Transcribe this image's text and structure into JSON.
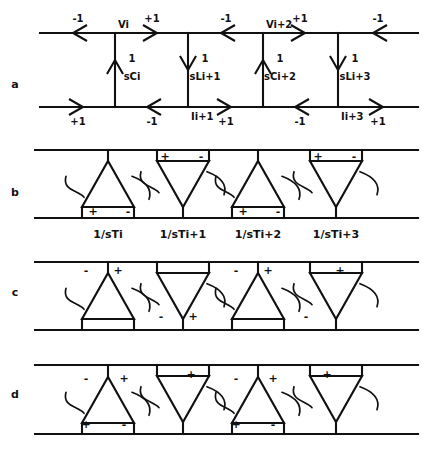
{
  "figure": {
    "type": "circuit-signal-flow-diagram",
    "width": 428,
    "height": 458,
    "ink_color": "#111111",
    "background": "#ffffff"
  },
  "panels": [
    {
      "id": "a",
      "label": "a",
      "label_x": 15,
      "label_y": 88,
      "kind": "lc-ladder",
      "top_rail_y": 33,
      "bottom_rail_y": 107,
      "rail_x0": 40,
      "rail_x1": 418,
      "branches": [
        {
          "x": 115,
          "direction": "up",
          "numerator": "1",
          "denominator": "sCi",
          "num_x": 132,
          "num_y": 62,
          "den_x": 132,
          "den_y": 80
        },
        {
          "x": 188,
          "direction": "down",
          "numerator": "1",
          "denominator": "sLi+1",
          "num_x": 205,
          "num_y": 62,
          "den_x": 205,
          "den_y": 80
        },
        {
          "x": 263,
          "direction": "up",
          "numerator": "1",
          "denominator": "sCi+2",
          "num_x": 280,
          "num_y": 62,
          "den_x": 280,
          "den_y": 80
        },
        {
          "x": 338,
          "direction": "down",
          "numerator": "1",
          "denominator": "sLi+3",
          "num_x": 355,
          "num_y": 62,
          "den_x": 355,
          "den_y": 80
        }
      ],
      "top_arrows": [
        {
          "x": 78,
          "direction": "left",
          "gain": "-1",
          "gain_x": 78,
          "gain_y": 22
        },
        {
          "x": 152,
          "direction": "right",
          "gain": "+1",
          "gain_x": 152,
          "gain_y": 22
        },
        {
          "x": 226,
          "direction": "left",
          "gain": "-1",
          "gain_x": 226,
          "gain_y": 22
        },
        {
          "x": 300,
          "direction": "right",
          "gain": "+1",
          "gain_x": 300,
          "gain_y": 22
        },
        {
          "x": 378,
          "direction": "left",
          "gain": "-1",
          "gain_x": 378,
          "gain_y": 22
        }
      ],
      "bottom_arrows": [
        {
          "x": 78,
          "direction": "right",
          "gain": "+1",
          "gain_x": 78,
          "gain_y": 125
        },
        {
          "x": 152,
          "direction": "left",
          "gain": "-1",
          "gain_x": 152,
          "gain_y": 125
        },
        {
          "x": 226,
          "direction": "right",
          "gain": "+1",
          "gain_x": 226,
          "gain_y": 125
        },
        {
          "x": 300,
          "direction": "left",
          "gain": "-1",
          "gain_x": 300,
          "gain_y": 125
        },
        {
          "x": 378,
          "direction": "right",
          "gain": "+1",
          "gain_x": 378,
          "gain_y": 125
        }
      ],
      "node_labels": [
        {
          "text": "Vi",
          "x": 118,
          "y": 28,
          "anchor": "start"
        },
        {
          "text": "Vi+2",
          "x": 266,
          "y": 28,
          "anchor": "start"
        },
        {
          "text": "Ii+1",
          "x": 191,
          "y": 120,
          "anchor": "start"
        },
        {
          "text": "Ii+3",
          "x": 341,
          "y": 120,
          "anchor": "start"
        }
      ]
    },
    {
      "id": "b",
      "label": "b",
      "label_x": 15,
      "label_y": 196,
      "kind": "amplifier-row",
      "top_rail_y": 150,
      "bottom_rail_y": 218,
      "rail_x0": 35,
      "rail_x1": 418,
      "caption_y": 238,
      "elements": [
        {
          "x": 108,
          "orientation": "up",
          "caption": "1/sTi",
          "caption_x": 108,
          "signs": [
            {
              "t": "+",
              "x": 93,
              "y": 215
            },
            {
              "t": "-",
              "x": 128,
              "y": 215
            }
          ]
        },
        {
          "x": 183,
          "orientation": "down",
          "caption": "1/sTi+1",
          "caption_x": 183,
          "signs": [
            {
              "t": "+",
              "x": 165,
              "y": 160
            },
            {
              "t": "-",
              "x": 201,
              "y": 160
            }
          ]
        },
        {
          "x": 258,
          "orientation": "up",
          "caption": "1/sTi+2",
          "caption_x": 258,
          "signs": [
            {
              "t": "+",
              "x": 243,
              "y": 215
            },
            {
              "t": "-",
              "x": 278,
              "y": 215
            }
          ]
        },
        {
          "x": 336,
          "orientation": "down",
          "caption": "1/sTi+3",
          "caption_x": 336,
          "signs": [
            {
              "t": "+",
              "x": 318,
              "y": 160
            },
            {
              "t": "-",
              "x": 354,
              "y": 160
            }
          ]
        }
      ]
    },
    {
      "id": "c",
      "label": "c",
      "label_x": 15,
      "label_y": 296,
      "kind": "amplifier-row",
      "top_rail_y": 262,
      "bottom_rail_y": 330,
      "rail_x0": 35,
      "rail_x1": 418,
      "elements": [
        {
          "x": 108,
          "orientation": "up",
          "signs": [
            {
              "t": "-",
              "x": 86,
              "y": 274
            },
            {
              "t": "+",
              "x": 118,
              "y": 274
            }
          ]
        },
        {
          "x": 183,
          "orientation": "down",
          "signs": [
            {
              "t": "-",
              "x": 161,
              "y": 320
            },
            {
              "t": "+",
              "x": 193,
              "y": 320
            }
          ]
        },
        {
          "x": 258,
          "orientation": "up",
          "signs": [
            {
              "t": "-",
              "x": 236,
              "y": 274
            },
            {
              "t": "+",
              "x": 268,
              "y": 274
            }
          ]
        },
        {
          "x": 336,
          "orientation": "down",
          "signs": [
            {
              "t": "-",
              "x": 306,
              "y": 320
            },
            {
              "t": "+",
              "x": 340,
              "y": 274
            }
          ]
        }
      ]
    },
    {
      "id": "d",
      "label": "d",
      "label_x": 15,
      "label_y": 398,
      "kind": "amplifier-row",
      "top_rail_y": 365,
      "bottom_rail_y": 434,
      "rail_x0": 35,
      "rail_x1": 418,
      "elements": [
        {
          "x": 108,
          "orientation": "up",
          "signs": [
            {
              "t": "-",
              "x": 86,
              "y": 382
            },
            {
              "t": "+",
              "x": 124,
              "y": 382
            },
            {
              "t": "+",
              "x": 86,
              "y": 428
            },
            {
              "t": "-",
              "x": 124,
              "y": 428
            }
          ]
        },
        {
          "x": 183,
          "orientation": "down",
          "signs": [
            {
              "t": "+",
              "x": 191,
              "y": 378
            }
          ]
        },
        {
          "x": 258,
          "orientation": "up",
          "signs": [
            {
              "t": "-",
              "x": 236,
              "y": 382
            },
            {
              "t": "+",
              "x": 273,
              "y": 382
            },
            {
              "t": "+",
              "x": 236,
              "y": 428
            },
            {
              "t": "-",
              "x": 273,
              "y": 428
            }
          ]
        },
        {
          "x": 336,
          "orientation": "down",
          "signs": [
            {
              "t": "+",
              "x": 327,
              "y": 378
            }
          ]
        }
      ]
    }
  ]
}
